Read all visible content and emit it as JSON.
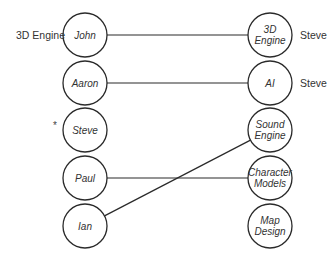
{
  "diagram": {
    "type": "bipartite-assignment",
    "left_nodes": [
      {
        "id": "john",
        "label": "John",
        "side_label": "3D Engine",
        "marker": ""
      },
      {
        "id": "aaron",
        "label": "Aaron",
        "side_label": "",
        "marker": ""
      },
      {
        "id": "steve",
        "label": "Steve",
        "side_label": "",
        "marker": "*"
      },
      {
        "id": "paul",
        "label": "Paul",
        "side_label": "",
        "marker": ""
      },
      {
        "id": "ian",
        "label": "Ian",
        "side_label": "",
        "marker": ""
      }
    ],
    "right_nodes": [
      {
        "id": "3d-engine",
        "lines": [
          "3D",
          "Engine"
        ],
        "side_label": "Steve"
      },
      {
        "id": "ai",
        "lines": [
          "AI"
        ],
        "side_label": "Steve"
      },
      {
        "id": "sound-engine",
        "lines": [
          "Sound",
          "Engine"
        ],
        "side_label": ""
      },
      {
        "id": "character-models",
        "lines": [
          "Character",
          "Models"
        ],
        "side_label": ""
      },
      {
        "id": "map-design",
        "lines": [
          "Map",
          "Design"
        ],
        "side_label": ""
      }
    ],
    "edges": [
      {
        "from": "john",
        "to": "3d-engine"
      },
      {
        "from": "aaron",
        "to": "ai"
      },
      {
        "from": "paul",
        "to": "character-models"
      },
      {
        "from": "ian",
        "to": "sound-engine"
      }
    ],
    "colors": {
      "stroke": "#2a2a2a",
      "text": "#333333",
      "background": "#ffffff"
    }
  }
}
